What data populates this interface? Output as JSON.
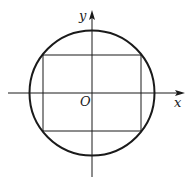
{
  "diagram": {
    "axes": {
      "x_label": "x",
      "y_label": "y",
      "origin_label": "O"
    },
    "colors": {
      "stroke": "#1a1a1a",
      "background": "#ffffff"
    },
    "shapes": {
      "circle": {
        "cx": 92,
        "cy": 93,
        "r": 62.5
      },
      "rectangle": {
        "x1": 43,
        "y1": 55,
        "x2": 141,
        "y2": 131
      }
    }
  }
}
